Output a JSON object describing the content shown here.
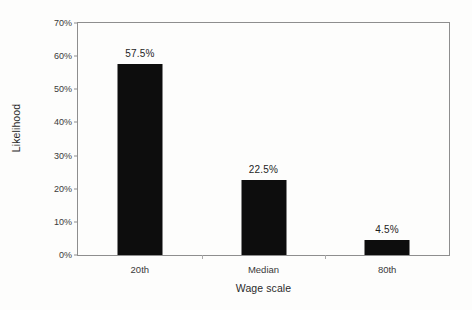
{
  "chart_data": {
    "type": "bar",
    "title": "",
    "xlabel": "Wage scale",
    "ylabel": "Likelihood",
    "categories": [
      "20th",
      "Median",
      "80th"
    ],
    "values": [
      57.5,
      22.5,
      4.5
    ],
    "value_labels": [
      "57.5%",
      "22.5%",
      "4.5%"
    ],
    "ylim": [
      0,
      70
    ],
    "ytick_values": [
      0,
      10,
      20,
      30,
      40,
      50,
      60,
      70
    ],
    "ytick_labels": [
      "0%",
      "10%",
      "20%",
      "30%",
      "40%",
      "50%",
      "60%",
      "70%"
    ],
    "grid": false,
    "legend": false,
    "bar_color": "#0d0d0d",
    "axis_color": "#8e8e8e",
    "background_color": "#fdfdfc"
  }
}
